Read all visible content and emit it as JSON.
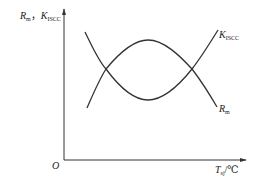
{
  "chart_data": {
    "type": "line",
    "title": "",
    "xlabel": {
      "main": "T",
      "sub": "sj",
      "unit": "/℃"
    },
    "ylabel": {
      "parts": [
        {
          "main": "R",
          "sub": "m"
        },
        {
          "main": "K",
          "sub": "ISCC"
        }
      ],
      "separator": "，"
    },
    "origin_label": "O",
    "axis_ticks": "none",
    "grid": false,
    "legend": "inline labels at right end of curves",
    "x_range_qualitative": [
      "low temperature",
      "high temperature"
    ],
    "series": [
      {
        "name": "R_m",
        "label_main": "R",
        "label_sub": "m",
        "shape": "U-shaped (decreases, minimum at mid temperature, then increases-then... drops)",
        "points_px": [
          [
            85,
            32
          ],
          [
            106,
            69
          ],
          [
            148,
            100
          ],
          [
            192,
            69
          ],
          [
            217,
            107
          ]
        ],
        "description": "Starts high at left, falls through first intersection to a minimum near the middle, rises to the second intersection then falls again to the right"
      },
      {
        "name": "K_ISCC",
        "label_main": "K",
        "label_sub": "ISCC",
        "points_px": [
          [
            87,
            108
          ],
          [
            106,
            69
          ],
          [
            148,
            40
          ],
          [
            192,
            69
          ],
          [
            218,
            30
          ]
        ],
        "description": "Starts low at left, rises through first intersection to a maximum near the middle, falls to second intersection then rises again to the right"
      }
    ],
    "intersections_px": [
      [
        106,
        69
      ],
      [
        192,
        69
      ]
    ]
  },
  "geometry": {
    "y_axis": {
      "x": 64,
      "y_top": 9,
      "y_bottom": 160
    },
    "x_axis": {
      "y": 160,
      "x_left": 64,
      "x_right": 246
    },
    "colors": {
      "line": "#333333",
      "axis": "#333333",
      "text": "#222222"
    }
  },
  "paths": {
    "rm": "M85,32 C92,46 98,60 106,69 C120,88 134,100 148,100 C164,100 180,84 192,69 C202,82 210,95 217,107",
    "k": "M87,108 C94,92 99,80 106,69 C120,52 134,40 148,40 C164,40 180,56 192,69 C202,56 210,43 218,30"
  }
}
